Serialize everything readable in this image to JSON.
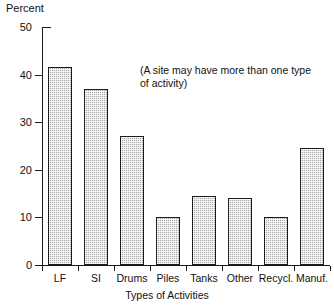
{
  "chart_data": {
    "type": "bar",
    "title": "",
    "xlabel": "Types of Activities",
    "ylabel": "Percent",
    "categories": [
      "LF",
      "SI",
      "Drums",
      "Piles",
      "Tanks",
      "Other",
      "Recycl.",
      "Manuf."
    ],
    "values": [
      41.5,
      37,
      27,
      10,
      14.5,
      14,
      10,
      24.5
    ],
    "ylim": [
      0,
      50
    ],
    "yticks": [
      0,
      10,
      20,
      30,
      40,
      50
    ],
    "ytick_labels": [
      "0",
      "10",
      "20",
      "30",
      "40",
      "50"
    ],
    "grid": false,
    "legend": null,
    "annotations": [
      "(A site may have more than one type",
      "of activity)"
    ],
    "bar_fill_color": "#a8a8a8",
    "bar_edge_color": "#1c1c1c",
    "axis_color": "#1a1a1a",
    "background_color": "#ffffff"
  }
}
